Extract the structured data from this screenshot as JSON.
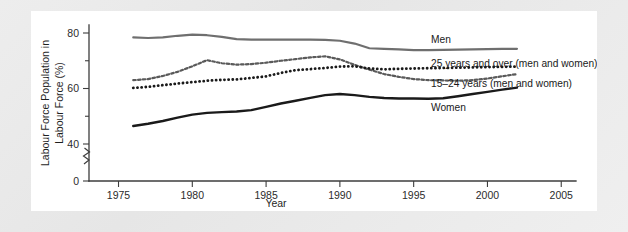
{
  "figure": {
    "background_color": "#ececec",
    "panel_color": "#ffffff"
  },
  "chart_data": {
    "type": "line",
    "title": "",
    "xlabel": "Year",
    "ylabel": "Labour Force Population in Labour Force (%)",
    "xlim": [
      1973,
      2006
    ],
    "ylim": [
      0,
      84
    ],
    "xticks": [
      1975,
      1980,
      1985,
      1990,
      1995,
      2000,
      2005
    ],
    "xticklabels": [
      "1975",
      "1980",
      "1985",
      "1990",
      "1995",
      "2000",
      "2005"
    ],
    "yticks": [
      0,
      40,
      60,
      80
    ],
    "yticklabels": [
      "0",
      "40",
      "60",
      "80"
    ],
    "y_minor_ticks": [
      50,
      70
    ],
    "axis_break": true,
    "axis_break_between": [
      0,
      40
    ],
    "grid": false,
    "legend_position": "right-inline",
    "x": [
      1976,
      1977,
      1978,
      1979,
      1980,
      1981,
      1982,
      1983,
      1984,
      1985,
      1986,
      1987,
      1988,
      1989,
      1990,
      1991,
      1992,
      1993,
      1994,
      1995,
      1996,
      1997,
      1998,
      1999,
      2000,
      2001,
      2002
    ],
    "series": [
      {
        "name": "Men",
        "color": "#6f6f6f",
        "style": "solid",
        "width": 2.2,
        "values": [
          78.4,
          78.2,
          78.4,
          79.0,
          79.4,
          79.2,
          78.6,
          77.8,
          77.6,
          77.6,
          77.6,
          77.6,
          77.6,
          77.5,
          77.2,
          76.2,
          74.5,
          74.3,
          74.1,
          73.8,
          73.8,
          73.9,
          74.0,
          74.1,
          74.2,
          74.3,
          74.3
        ]
      },
      {
        "name": "25 years and over (men and women)",
        "color": "#5a5a5a",
        "style": "dashed",
        "width": 2.2,
        "values": [
          63.0,
          63.4,
          64.5,
          66.0,
          68.0,
          70.2,
          69.1,
          68.6,
          68.8,
          69.3,
          70.0,
          70.6,
          71.2,
          71.6,
          70.5,
          68.5,
          66.8,
          65.2,
          64.2,
          63.4,
          63.0,
          62.9,
          62.8,
          63.0,
          63.6,
          64.4,
          65.2
        ]
      },
      {
        "name": "15–24 years (men and women)",
        "color": "#1a1a1a",
        "style": "dotted",
        "width": 2.8,
        "values": [
          60.2,
          60.6,
          61.2,
          61.8,
          62.3,
          62.8,
          63.1,
          63.3,
          63.8,
          64.4,
          65.6,
          66.6,
          67.0,
          67.4,
          67.9,
          68.0,
          67.2,
          66.9,
          67.1,
          67.2,
          67.3,
          67.4,
          67.5,
          67.6,
          67.7,
          67.8,
          67.9
        ]
      },
      {
        "name": "Women",
        "color": "#1a1a1a",
        "style": "solid",
        "width": 2.4,
        "values": [
          46.5,
          47.3,
          48.3,
          49.5,
          50.6,
          51.2,
          51.5,
          51.7,
          52.2,
          53.4,
          54.6,
          55.6,
          56.6,
          57.6,
          58.0,
          57.6,
          57.0,
          56.6,
          56.4,
          56.4,
          56.3,
          56.5,
          57.2,
          58.0,
          58.8,
          59.6,
          60.3
        ]
      }
    ],
    "legend_entries": [
      {
        "label": "Men",
        "color": "#6f6f6f",
        "style": "solid"
      },
      {
        "label": "25 years and over (men and women)",
        "color": "#5a5a5a",
        "style": "dashed"
      },
      {
        "label": "15–24 years (men and women)",
        "color": "#1a1a1a",
        "style": "dotted"
      },
      {
        "label": "Women",
        "color": "#1a1a1a",
        "style": "solid"
      }
    ]
  }
}
